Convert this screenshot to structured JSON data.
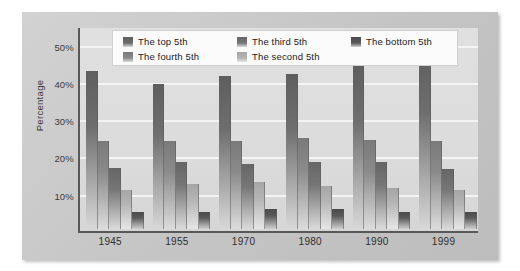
{
  "chart_data": {
    "type": "bar",
    "title": "",
    "subtitle": "",
    "xlabel": "",
    "ylabel": "Percentage",
    "categories": [
      "1945",
      "1955",
      "1970",
      "1980",
      "1990",
      "1999"
    ],
    "ylim": [
      0,
      55
    ],
    "yticks": [
      10,
      20,
      30,
      40,
      50
    ],
    "ytick_labels": [
      "10%",
      "20%",
      "30%",
      "40%",
      "50%"
    ],
    "grid": true,
    "legend_position": "top-center",
    "series": [
      {
        "name": "The top 5th",
        "color": "#6e6e6e",
        "gradient_top": "#5e5e5e",
        "gradient_bottom": "#d8d8d8",
        "values": [
          42.5,
          39.0,
          41.0,
          41.5,
          44.5,
          48.0
        ]
      },
      {
        "name": "The fourth 5th",
        "color": "#8a8a8a",
        "gradient_top": "#7a7a7a",
        "gradient_bottom": "#dcdcdc",
        "values": [
          23.5,
          23.5,
          23.5,
          24.5,
          24.0,
          23.5
        ]
      },
      {
        "name": "The third 5th",
        "color": "#767676",
        "gradient_top": "#666666",
        "gradient_bottom": "#dadada",
        "values": [
          16.5,
          18.0,
          17.5,
          18.0,
          18.0,
          16.0
        ]
      },
      {
        "name": "The second 5th",
        "color": "#b4b4b4",
        "gradient_top": "#a6a6a6",
        "gradient_bottom": "#e6e6e6",
        "values": [
          10.5,
          12.0,
          12.5,
          11.5,
          11.0,
          10.5
        ]
      },
      {
        "name": "The bottom 5th",
        "color": "#5a5a5a",
        "gradient_top": "#4a4a4a",
        "gradient_bottom": "#cfcfcf",
        "values": [
          4.5,
          4.5,
          5.5,
          5.5,
          4.5,
          4.5
        ]
      }
    ]
  },
  "legend": {
    "entries": [
      {
        "label": "The top 5th",
        "column": 0,
        "row": 0
      },
      {
        "label": "The fourth 5th",
        "column": 0,
        "row": 1
      },
      {
        "label": "The third 5th",
        "column": 1,
        "row": 0
      },
      {
        "label": "The second 5th",
        "column": 1,
        "row": 1
      },
      {
        "label": "The bottom 5th",
        "column": 2,
        "row": 0
      }
    ]
  },
  "colors": {
    "panel_background": "#c9c9c9",
    "plot_background": "#dcdcdc",
    "gridline": "#f4f4f4",
    "axis": "#585858",
    "text": "#2e2e2e",
    "legend_background": "#fbfbfb"
  }
}
